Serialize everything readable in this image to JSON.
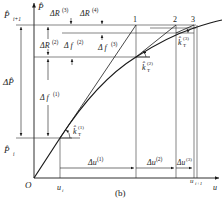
{
  "figure": {
    "caption": "(b)",
    "axes": {
      "y_label": "P̂",
      "x_label": "u",
      "origin": "O"
    },
    "y_marks": {
      "p_i1": "P̂",
      "p_i1_sub": "i+1",
      "p_i": "P̂",
      "p_i_sub": "i",
      "delta_p": "ΔP̂"
    },
    "x_marks": {
      "u_i": "u",
      "u_i_sub": "i",
      "u_i1": "u",
      "u_i1_sub": "i+1"
    },
    "increments": {
      "dR2": "ΔR",
      "dR2_sup": "(2)",
      "dR3": "ΔR",
      "dR3_sup": "(3)",
      "dR4": "ΔR",
      "dR4_sup": "(4)",
      "df1": "Δ f",
      "df1_sup": "(1)",
      "df2": "Δ f",
      "df2_sup": "(2)",
      "df3": "Δ f",
      "df3_sup": "(3)",
      "du1": "Δu",
      "du1_sup": "(1)",
      "du2": "Δu",
      "du2_sup": "(2)",
      "du3": "Δu",
      "du3_sup": "(3)"
    },
    "tangents": {
      "k1": "k̂",
      "k1_sub": "T",
      "k1_sup": "(1)",
      "k2": "k̂",
      "k2_sub": "T",
      "k2_sup": "(2)",
      "k3": "k̂",
      "k3_sub": "T",
      "k3_sup": "(3)"
    },
    "points": [
      "1",
      "2",
      "3"
    ],
    "colors": {
      "line": "#1a1a1a",
      "thin": "#333333"
    }
  }
}
